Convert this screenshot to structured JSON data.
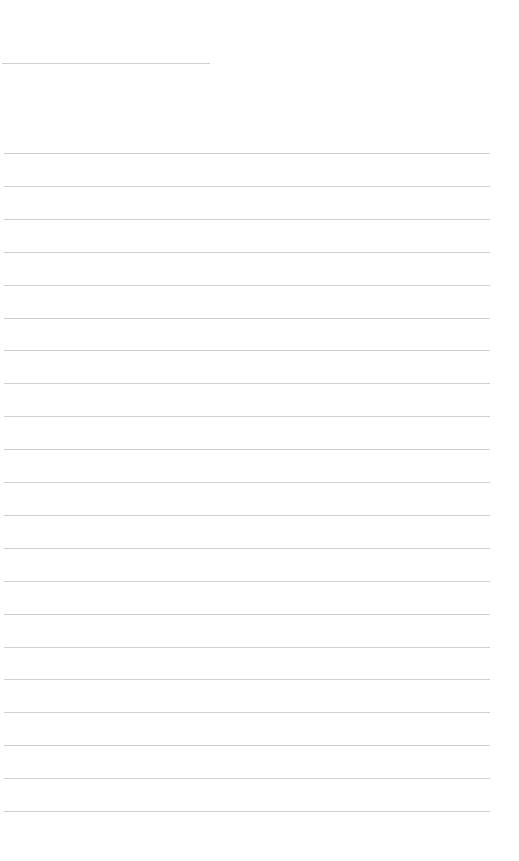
{
  "page": {
    "type": "blank ruled sheet",
    "background": "#ffffff",
    "line_color": "#cfcfcf",
    "title_line": {
      "top": 63,
      "left": 2,
      "width": 208
    },
    "ruled_lines": {
      "count": 21,
      "first_top": 153,
      "spacing": 32.9,
      "left": 4,
      "width": 486
    }
  }
}
